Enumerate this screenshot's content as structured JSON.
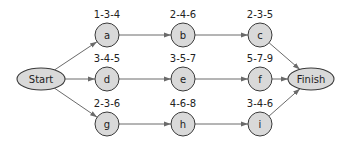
{
  "diagram": {
    "type": "pert-network",
    "start": {
      "id": "start",
      "label": "Start",
      "cx": 41,
      "cy": 79,
      "rx": 24,
      "ry": 11
    },
    "finish": {
      "id": "finish",
      "label": "Finish",
      "cx": 311,
      "cy": 79,
      "rx": 23,
      "ry": 11
    },
    "node_radius": 12,
    "nodes": [
      {
        "id": "a",
        "label": "a",
        "estimate": "1-3-4",
        "cx": 107,
        "cy": 35
      },
      {
        "id": "b",
        "label": "b",
        "estimate": "2-4-6",
        "cx": 183,
        "cy": 35
      },
      {
        "id": "c",
        "label": "c",
        "estimate": "2-3-5",
        "cx": 260,
        "cy": 35
      },
      {
        "id": "d",
        "label": "d",
        "estimate": "3-4-5",
        "cx": 107,
        "cy": 79
      },
      {
        "id": "e",
        "label": "e",
        "estimate": "3-5-7",
        "cx": 183,
        "cy": 79
      },
      {
        "id": "f",
        "label": "f",
        "estimate": "5-7-9",
        "cx": 260,
        "cy": 79
      },
      {
        "id": "g",
        "label": "g",
        "estimate": "2-3-6",
        "cx": 107,
        "cy": 124
      },
      {
        "id": "h",
        "label": "h",
        "estimate": "4-6-8",
        "cx": 183,
        "cy": 124
      },
      {
        "id": "i",
        "label": "i",
        "estimate": "3-4-6",
        "cx": 260,
        "cy": 124
      }
    ],
    "edges": [
      {
        "from": "start",
        "to": "a"
      },
      {
        "from": "start",
        "to": "d"
      },
      {
        "from": "start",
        "to": "g"
      },
      {
        "from": "a",
        "to": "b"
      },
      {
        "from": "b",
        "to": "c"
      },
      {
        "from": "d",
        "to": "e"
      },
      {
        "from": "e",
        "to": "f"
      },
      {
        "from": "g",
        "to": "h"
      },
      {
        "from": "h",
        "to": "i"
      },
      {
        "from": "c",
        "to": "finish"
      },
      {
        "from": "f",
        "to": "finish"
      },
      {
        "from": "i",
        "to": "finish"
      }
    ],
    "colors": {
      "node_fill": "#d9d9d9",
      "stroke": "#3a3a3a",
      "edge": "#6a6a6a",
      "text": "#222222"
    }
  }
}
